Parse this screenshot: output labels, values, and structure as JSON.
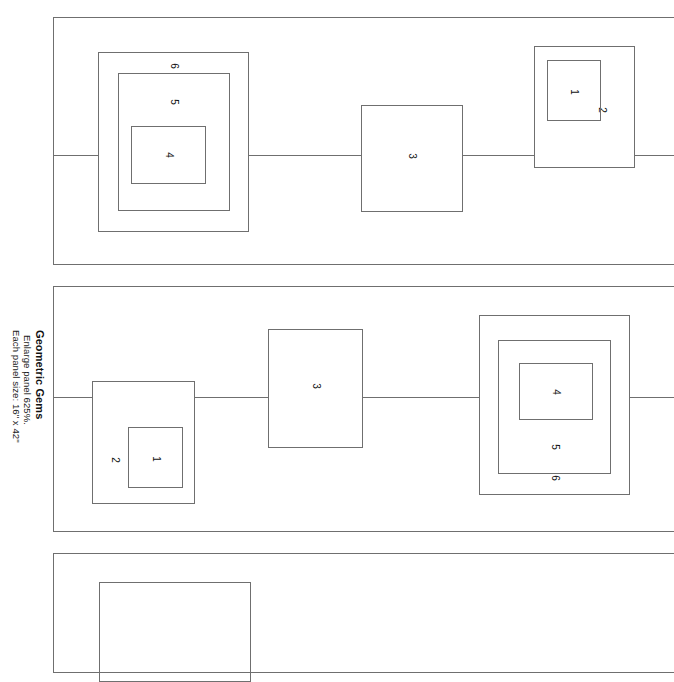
{
  "document": {
    "title": "Geometric Gems",
    "instruction": "Enlarge panel 625%.",
    "panel_size_note": "Each panel size: 16\" x 42\"",
    "background_color": "#ffffff",
    "stroke_color": "#6f6f6f",
    "text_color": "#1a1a1a"
  },
  "panels": [
    {
      "name": "panel-1",
      "groups": [
        {
          "name": "nested-group-left",
          "labels": [
            "6",
            "5",
            "4"
          ]
        },
        {
          "name": "single-rect-middle",
          "labels": [
            "3"
          ]
        },
        {
          "name": "nested-group-right",
          "labels": [
            "2",
            "1"
          ]
        }
      ]
    },
    {
      "name": "panel-2",
      "groups": [
        {
          "name": "nested-group-left",
          "labels": [
            "2",
            "1"
          ]
        },
        {
          "name": "single-rect-middle",
          "labels": [
            "3"
          ]
        },
        {
          "name": "nested-group-right",
          "labels": [
            "6",
            "5",
            "4"
          ]
        }
      ]
    },
    {
      "name": "panel-3",
      "groups": [
        {
          "name": "nested-group-left-partial",
          "labels": []
        }
      ]
    }
  ],
  "labels": {
    "p1_l_outer": "6",
    "p1_l_mid": "5",
    "p1_l_inner": "4",
    "p1_m": "3",
    "p1_r_outer": "2",
    "p1_r_inner": "1",
    "p2_l_outer": "2",
    "p2_l_inner": "1",
    "p2_m": "3",
    "p2_r_outer": "6",
    "p2_r_mid": "5",
    "p2_r_inner": "4"
  }
}
